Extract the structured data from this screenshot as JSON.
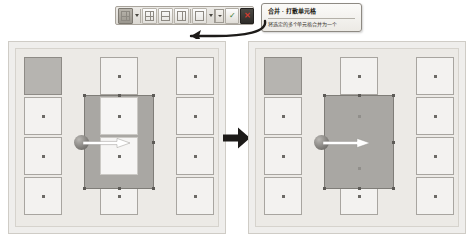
{
  "toolbar": {
    "buttons": [
      {
        "name": "merge-cells-button",
        "icon": "grid-merge-icon",
        "state": "active"
      },
      {
        "name": "split-cells-button",
        "icon": "grid-split-icon",
        "state": "normal"
      },
      {
        "name": "split-horizontally-button",
        "icon": "split-horizontal-icon",
        "state": "normal"
      },
      {
        "name": "split-vertically-button",
        "icon": "split-vertical-icon",
        "state": "normal"
      },
      {
        "name": "border-style-button",
        "icon": "border-icon",
        "state": "normal"
      }
    ],
    "combo": {
      "name": "line-style-select",
      "value": "直线",
      "caret_icon": "chevron-down-icon"
    },
    "confirm_button": {
      "name": "apply-button",
      "icon": "check-icon",
      "glyph": "✓"
    },
    "cancel_button": {
      "name": "close-button",
      "icon": "close-icon",
      "glyph": "✕"
    }
  },
  "tooltip": {
    "title": "合并 · 打散单元格",
    "body": "将选定的多个单元格合并为一个"
  },
  "panels": {
    "before": {
      "name": "before-panel",
      "label": "before",
      "selection": {
        "name": "selection-rectangle",
        "handles": 8
      }
    },
    "after": {
      "name": "after-panel",
      "label": "after",
      "selection": {
        "name": "merged-rectangle",
        "handles": 8
      }
    }
  },
  "transition": {
    "name": "transition-arrow",
    "icon": "arrow-right-icon"
  },
  "cursor": {
    "name": "drag-cursor",
    "icon": "arrow-right-icon"
  },
  "colors": {
    "panel_bg": "#efeeec",
    "stage_bg": "#eceae6",
    "cell_bg": "#f3f2f0",
    "cell_border": "#a8a5a0",
    "selection_fill": "#a9a7a3",
    "selection_border": "#7f7d78",
    "filled_cell": "#b6b4b0",
    "accent_close": "#d23b2f",
    "arrow_black": "#1d1b19"
  }
}
